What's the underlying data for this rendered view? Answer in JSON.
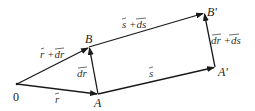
{
  "diagram": {
    "type": "vector-diagram",
    "points": {
      "O": {
        "label": "0",
        "x": 17,
        "y": 84
      },
      "A": {
        "label": "A",
        "x": 98,
        "y": 94
      },
      "B": {
        "label": "B",
        "x": 89,
        "y": 47
      },
      "A_prime": {
        "label": "A'",
        "x": 215,
        "y": 67
      },
      "B_prime": {
        "label": "B'",
        "x": 204,
        "y": 13
      }
    },
    "vectors": [
      {
        "from": "O",
        "to": "A",
        "label": "r"
      },
      {
        "from": "O",
        "to": "B",
        "label": "r + dr"
      },
      {
        "from": "A",
        "to": "B",
        "label": "dr"
      },
      {
        "from": "A",
        "to": "A_prime",
        "label": "s"
      },
      {
        "from": "B",
        "to": "B_prime",
        "label": "s + ds"
      },
      {
        "from": "A_prime",
        "to": "B_prime",
        "label": "dr + ds"
      }
    ],
    "labels": {
      "origin": "0",
      "A": "A",
      "B": "B",
      "A_prime": "A'",
      "B_prime": "B'",
      "r": "r",
      "r_plus_dr": "r +dr",
      "dr": "dr",
      "s": "s",
      "s_plus_ds": "s +ds",
      "dr_plus_ds": "dr +ds"
    },
    "colors": {
      "line": "#1a1a1a",
      "text": "#333333",
      "background": "#ffffff"
    }
  }
}
